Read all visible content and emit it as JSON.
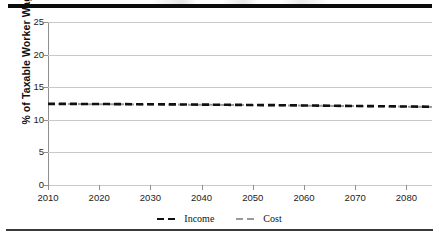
{
  "figure": {
    "top_rule": "thick-black-rule",
    "bottom_rule": "thin-gray-rule"
  },
  "chart_data": {
    "type": "line",
    "title": "",
    "xlabel": "",
    "ylabel": "% of Taxable Worker Wages",
    "xlim": [
      2010,
      2085
    ],
    "ylim": [
      0,
      25
    ],
    "grid": true,
    "legend_position": "bottom-center",
    "xticks": [
      2010,
      2020,
      2030,
      2040,
      2050,
      2060,
      2070,
      2080
    ],
    "xtick_labels": [
      "2010",
      "2020",
      "2030",
      "2040",
      "2050",
      "2060",
      "2070",
      "2080"
    ],
    "yticks": [
      0,
      5,
      10,
      15,
      20,
      25
    ],
    "ytick_labels": [
      "0",
      "5",
      "10",
      "15",
      "20",
      "25"
    ],
    "x": [
      2010,
      2015,
      2020,
      2025,
      2030,
      2035,
      2040,
      2045,
      2050,
      2055,
      2060,
      2065,
      2070,
      2075,
      2080,
      2085
    ],
    "series": [
      {
        "name": "Income",
        "color": "#111111",
        "style": "dashed",
        "values": [
          12.45,
          12.44,
          12.42,
          12.4,
          12.38,
          12.36,
          12.33,
          12.3,
          12.27,
          12.24,
          12.2,
          12.16,
          12.12,
          12.08,
          12.04,
          12.0
        ]
      },
      {
        "name": "Cost",
        "color": "#9a9a9a",
        "style": "dashed",
        "values": [
          12.42,
          12.41,
          12.39,
          12.37,
          12.35,
          12.33,
          12.31,
          12.28,
          12.25,
          12.22,
          12.18,
          12.14,
          12.1,
          12.06,
          12.02,
          11.98
        ]
      }
    ]
  },
  "legend": {
    "items": [
      {
        "label": "Income",
        "color": "#111111"
      },
      {
        "label": "Cost",
        "color": "#9a9a9a"
      }
    ]
  }
}
